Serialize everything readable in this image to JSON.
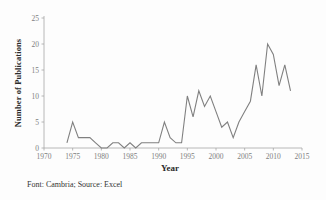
{
  "caption": "Font: Cambria; Source: Excel",
  "colors": {
    "line": "#808080",
    "axis": "#a6a6a6",
    "tick_text": "#808080",
    "title_text": "#2b2b2b",
    "background": "#fdfdfd"
  },
  "chart_data": {
    "type": "line",
    "title": "",
    "xlabel": "Year",
    "ylabel": "Number of Publications",
    "xlim": [
      1970,
      2015
    ],
    "ylim": [
      0,
      25
    ],
    "xticks": [
      1970,
      1975,
      1980,
      1985,
      1990,
      1995,
      2000,
      2005,
      2010,
      2015
    ],
    "yticks": [
      0,
      5,
      10,
      15,
      20,
      25
    ],
    "grid": false,
    "legend": null,
    "series": [
      {
        "name": "Number of Publications",
        "x": [
          1974,
          1975,
          1976,
          1977,
          1978,
          1979,
          1980,
          1981,
          1982,
          1983,
          1984,
          1985,
          1986,
          1987,
          1988,
          1989,
          1990,
          1991,
          1992,
          1993,
          1994,
          1995,
          1996,
          1997,
          1998,
          1999,
          2000,
          2001,
          2002,
          2003,
          2004,
          2005,
          2006,
          2007,
          2008,
          2009,
          2010,
          2011,
          2012,
          2013
        ],
        "values": [
          1,
          5,
          2,
          2,
          2,
          1,
          0,
          0,
          1,
          1,
          0,
          1,
          0,
          1,
          1,
          1,
          1,
          5,
          2,
          1,
          1,
          10,
          6,
          11,
          8,
          10,
          7,
          4,
          5,
          2,
          5,
          7,
          9,
          16,
          10,
          20,
          18,
          12,
          16,
          11
        ]
      }
    ]
  }
}
